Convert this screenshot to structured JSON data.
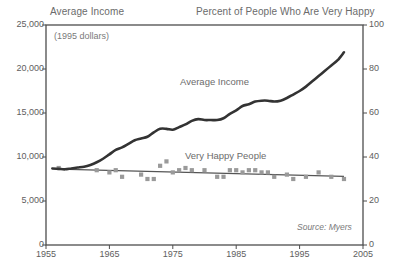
{
  "header": {
    "left_title": "Average Income",
    "right_title": "Percent of People Who Are Very Happy"
  },
  "annotations": {
    "subtitle": "(1995 dollars)",
    "income_label": "Average Income",
    "happy_label": "Very Happy People",
    "source": "Source: Myers"
  },
  "colors": {
    "income_line": "#333333",
    "happy_marker": "#9a9a9a",
    "happy_trend": "#555555",
    "axis": "#4d4d4d",
    "text": "#5e5e5e"
  },
  "chart_data": {
    "type": "line",
    "subtitle": "(1995 dollars)",
    "xlabel": "",
    "ylabel": "Average Income",
    "y2label": "Percent of People Who Are Very Happy",
    "xlim": [
      1955,
      2005
    ],
    "ylim": [
      0,
      25000
    ],
    "y2lim": [
      0,
      100
    ],
    "grid": false,
    "legend": "inline-annotations",
    "xticks": [
      1955,
      1965,
      1975,
      1985,
      1995,
      2005
    ],
    "yticks_left": [
      "0",
      "5,000",
      "10,000",
      "15,000",
      "20,000",
      "25,000"
    ],
    "yticks_left_values": [
      0,
      5000,
      10000,
      15000,
      20000,
      25000
    ],
    "yticks_right": [
      "0",
      "20",
      "40",
      "60",
      "80",
      "100"
    ],
    "yticks_right_values": [
      0,
      20,
      40,
      60,
      80,
      100
    ],
    "source": "Source: Myers",
    "series": [
      {
        "name": "Average Income",
        "type": "line",
        "axis": "left",
        "unit": "1995 dollars",
        "x": [
          1956,
          1957,
          1958,
          1959,
          1960,
          1961,
          1962,
          1963,
          1964,
          1965,
          1966,
          1967,
          1968,
          1969,
          1970,
          1971,
          1972,
          1973,
          1974,
          1975,
          1976,
          1977,
          1978,
          1979,
          1980,
          1981,
          1982,
          1983,
          1984,
          1985,
          1986,
          1987,
          1988,
          1989,
          1990,
          1991,
          1992,
          1993,
          1994,
          1995,
          1996,
          1997,
          1998,
          1999,
          2000,
          2001,
          2002
        ],
        "values": [
          8700,
          8650,
          8600,
          8700,
          8800,
          8900,
          9100,
          9400,
          9800,
          10300,
          10800,
          11100,
          11500,
          11900,
          12100,
          12300,
          12800,
          13200,
          13200,
          13100,
          13400,
          13700,
          14100,
          14300,
          14200,
          14200,
          14200,
          14400,
          14900,
          15300,
          15800,
          16000,
          16300,
          16400,
          16400,
          16300,
          16400,
          16700,
          17100,
          17500,
          18000,
          18600,
          19200,
          19800,
          20400,
          21000,
          21900
        ]
      },
      {
        "name": "Very Happy People",
        "type": "scatter",
        "axis": "right",
        "unit": "percent",
        "x": [
          1957,
          1963,
          1965,
          1966,
          1967,
          1970,
          1971,
          1972,
          1973,
          1974,
          1975,
          1976,
          1977,
          1978,
          1980,
          1982,
          1983,
          1984,
          1985,
          1986,
          1987,
          1988,
          1989,
          1990,
          1991,
          1993,
          1994,
          1996,
          1998,
          2000,
          2002
        ],
        "values": [
          35,
          34,
          33,
          34,
          31,
          32,
          30,
          30,
          36,
          38,
          33,
          34,
          35,
          34,
          34,
          31,
          31,
          34,
          34,
          33,
          34,
          34,
          33,
          33,
          31,
          32,
          30,
          31,
          33,
          31,
          30
        ]
      },
      {
        "name": "Very Happy People trend",
        "type": "line",
        "axis": "right",
        "x": [
          1957,
          2002
        ],
        "values": [
          34.5,
          31.2
        ]
      }
    ]
  }
}
